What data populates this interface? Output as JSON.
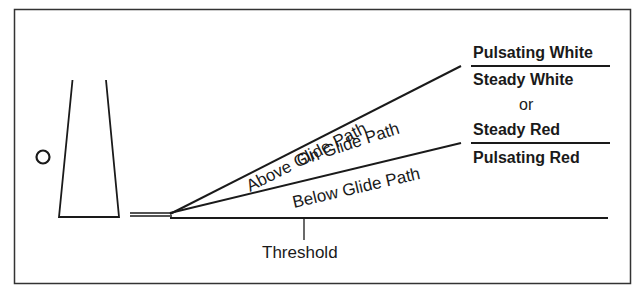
{
  "diagram": {
    "labels": {
      "above": "Above Glide Path",
      "on": "On Glide Path",
      "below": "Below Glide Path",
      "threshold": "Threshold"
    },
    "indications": {
      "above": "Pulsating White",
      "on_primary": "Steady White",
      "or": "or",
      "on_secondary": "Steady Red",
      "below": "Pulsating Red"
    },
    "colors": {
      "line": "#1a1a1a",
      "background": "#ffffff"
    }
  }
}
